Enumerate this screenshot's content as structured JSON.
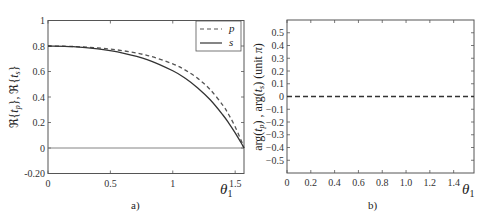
{
  "chart_data": [
    {
      "type": "line",
      "panel_label": "a)",
      "ylabel": "ℜ{t_p}, ℜ{t_s}",
      "xlabel": "θ1",
      "xlim": [
        0,
        1.5708
      ],
      "ylim": [
        -0.2,
        1.0
      ],
      "xticks": [
        0,
        0.5,
        1,
        1.5
      ],
      "xtick_labels": [
        "0",
        "0.5",
        "1",
        "1.5"
      ],
      "yticks": [
        -0.2,
        0,
        0.2,
        0.4,
        0.6,
        0.8,
        1
      ],
      "ytick_labels": [
        "-0.20",
        "0",
        "0.2",
        "0.4",
        "0.6",
        "0.8",
        "1"
      ],
      "grid": false,
      "legend_position": "top-right",
      "reference_line_y": 0,
      "x": [
        0,
        0.2,
        0.4,
        0.6,
        0.8,
        1.0,
        1.1,
        1.2,
        1.3,
        1.4,
        1.45,
        1.5,
        1.55,
        1.5708
      ],
      "series": [
        {
          "name": "p",
          "style": "dashed",
          "color": "#555555",
          "values": [
            0.8,
            0.796,
            0.785,
            0.763,
            0.725,
            0.66,
            0.611,
            0.546,
            0.458,
            0.337,
            0.259,
            0.166,
            0.054,
            0.0
          ]
        },
        {
          "name": "s",
          "style": "solid",
          "color": "#333333",
          "values": [
            0.8,
            0.795,
            0.777,
            0.745,
            0.692,
            0.606,
            0.547,
            0.471,
            0.378,
            0.261,
            0.194,
            0.119,
            0.037,
            0.0
          ]
        }
      ]
    },
    {
      "type": "line",
      "panel_label": "b)",
      "ylabel": "arg(t_p) ,  arg(t_s)   (unit π)",
      "xlabel": "θ1",
      "xlim": [
        0,
        1.5708
      ],
      "ylim": [
        -0.6,
        0.6
      ],
      "xticks": [
        0,
        0.2,
        0.4,
        0.6,
        0.8,
        1.0,
        1.2,
        1.4
      ],
      "xtick_labels": [
        "0",
        "0.2",
        "0.4",
        "0.6",
        "0.8",
        "1.0",
        "1.2",
        "1.4"
      ],
      "yticks": [
        -0.5,
        -0.4,
        -0.3,
        -0.2,
        -0.1,
        0,
        0.1,
        0.2,
        0.3,
        0.4,
        0.5
      ],
      "ytick_labels": [
        "−0.5",
        "−0.4",
        "−0.3",
        "−0.2",
        "−0.1",
        "0",
        "0.1",
        "0.2",
        "0.3",
        "0.4",
        "0.5"
      ],
      "grid": false,
      "x": [
        0,
        1.5708
      ],
      "series": [
        {
          "name": "arg(t_p), arg(t_s)",
          "style": "dashed",
          "color": "#333333",
          "values": [
            0,
            0
          ]
        }
      ]
    }
  ]
}
